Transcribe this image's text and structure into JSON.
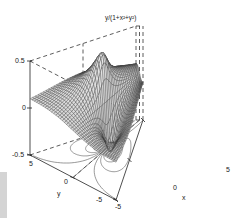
{
  "chart_data": {
    "type": "surface",
    "function": "z = y/(1+x^2+y^2)",
    "xlabel": "x",
    "ylabel": "y",
    "zlabel": "",
    "xlim": [
      -5,
      5
    ],
    "ylim": [
      -5,
      5
    ],
    "zlim": [
      -0.5,
      0.5
    ],
    "x_ticks": [
      "-5",
      "0",
      "5"
    ],
    "y_ticks": [
      "-5",
      "0",
      "5"
    ],
    "z_ticks": [
      "-0.5",
      "0",
      "0.5"
    ],
    "grid": false,
    "box": "dashed back edges",
    "contour_projection": true,
    "peak": {
      "x": 0,
      "y": 1,
      "z": 0.5
    },
    "trough": {
      "x": 0,
      "y": -1,
      "z": -0.5
    },
    "colors": {
      "mesh": "#333333",
      "contours": "#555555",
      "axes": "#222222"
    }
  },
  "labels": {
    "title": "y/(1+x²+y²)",
    "z_top": "0.5",
    "z_mid": "0",
    "z_bot": "-0.5",
    "y_5": "5",
    "y_0": "0",
    "y_m5": "-5",
    "y_label": "y",
    "x_m5": "-5",
    "x_0": "0",
    "x_5": "5",
    "x_label": "x"
  }
}
